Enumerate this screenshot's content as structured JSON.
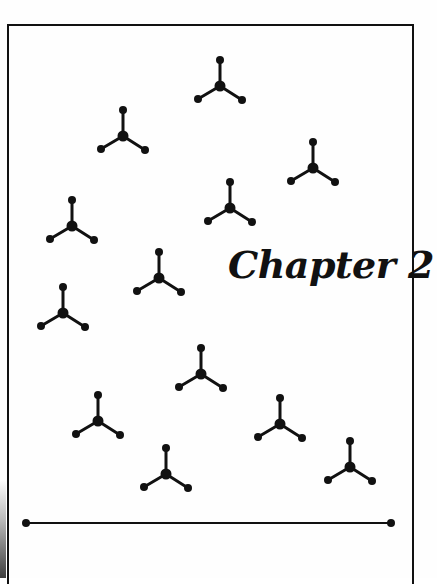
{
  "page": {
    "title": "Chapter 2",
    "ink_color": "#111111",
    "background_color": "#fefefe"
  },
  "molecules": [
    {
      "cx": 220,
      "cy": 86
    },
    {
      "cx": 123,
      "cy": 136
    },
    {
      "cx": 313,
      "cy": 168
    },
    {
      "cx": 230,
      "cy": 208
    },
    {
      "cx": 72,
      "cy": 226
    },
    {
      "cx": 159,
      "cy": 278
    },
    {
      "cx": 63,
      "cy": 313
    },
    {
      "cx": 201,
      "cy": 374
    },
    {
      "cx": 98,
      "cy": 421
    },
    {
      "cx": 280,
      "cy": 424
    },
    {
      "cx": 166,
      "cy": 474
    },
    {
      "cx": 350,
      "cy": 467
    }
  ],
  "divider": {
    "x1": 26,
    "x2": 391,
    "y": 523
  }
}
